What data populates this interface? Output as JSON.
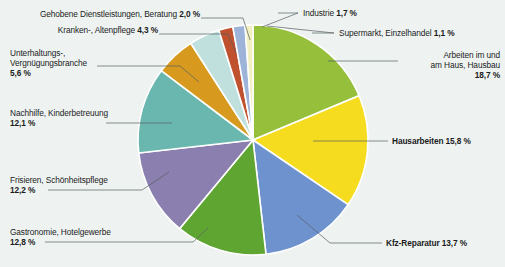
{
  "chart_data": {
    "type": "pie",
    "title": "",
    "unit": "%",
    "legend_position": "callout-labels",
    "grid": false,
    "background_color": "#eef3f2",
    "categories": [
      "Arbeiten im und am Haus, Hausbau",
      "Hausarbeiten",
      "Kfz-Reparatur",
      "Gastronomie, Hotelgewerbe",
      "Frisieren, Schönheitspflege",
      "Nachhilfe, Kinderbetreuung",
      "Unterhaltungs-, Vergnügungsbranche",
      "Kranken-, Altenpflege",
      "Gehobene Dienstleistungen, Beratung",
      "Industrie",
      "Supermarkt, Einzelhandel"
    ],
    "values": [
      18.7,
      15.8,
      13.7,
      12.8,
      12.2,
      12.1,
      5.6,
      4.3,
      2.0,
      1.7,
      1.1
    ],
    "value_labels": [
      "18,7 %",
      "15,8 %",
      "13,7 %",
      "12,8 %",
      "12,2 %",
      "12,1 %",
      "5,6 %",
      "4,3 %",
      "2,0 %",
      "1,7 %",
      "1,1 %"
    ],
    "colors": [
      "#96bf3c",
      "#f5dc1e",
      "#6e92ce",
      "#5fa532",
      "#8a7fae",
      "#69b7ae",
      "#d89a1e",
      "#bfe0dc",
      "#c0512f",
      "#9db4d8",
      "#f2efc0"
    ],
    "slice_gap_color": "#ffffff"
  },
  "labels": {
    "gehobene": {
      "text": "Gehobene Dienstleistungen, Beratung",
      "pct": "2,0 %"
    },
    "kranken": {
      "text": "Kranken-, Altenpflege",
      "pct": "4,3 %"
    },
    "unterhaltung_l1": "Unterhaltungs-,",
    "unterhaltung_l2": "Vergnügungsbranche",
    "unterhaltung_pct": "5,6 %",
    "nachhilfe_l1": "Nachhilfe, Kinderbetreuung",
    "nachhilfe_pct": "12,1 %",
    "frisieren_l1": "Frisieren, Schönheitspflege",
    "frisieren_pct": "12,2 %",
    "gastronomie_l1": "Gastronomie, Hotelgewerbe",
    "gastronomie_pct": "12,8 %",
    "industrie": {
      "text": "Industrie",
      "pct": "1,7 %"
    },
    "supermarkt": {
      "text": "Supermarkt, Einzelhandel",
      "pct": "1,1 %"
    },
    "arbeiten_l1": "Arbeiten im und",
    "arbeiten_l2": "am Haus, Hausbau",
    "arbeiten_pct": "18,7 %",
    "hausarbeiten": {
      "text": "Hausarbeiten",
      "pct": "15,8 %"
    },
    "kfz": {
      "text": "Kfz-Reparatur",
      "pct": "13,7 %"
    }
  }
}
